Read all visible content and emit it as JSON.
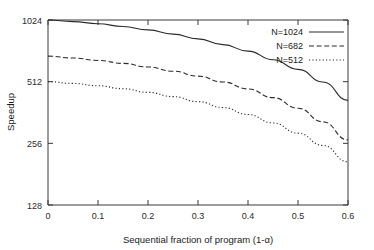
{
  "chart_data": {
    "type": "line",
    "title": "",
    "xlabel": "Sequential fraction of program (1-α)",
    "ylabel": "Speedup",
    "xlim": [
      0,
      0.6
    ],
    "ylim": [
      128,
      1024
    ],
    "yscale": "log2",
    "grid": false,
    "legend_position": "top-right",
    "xticks": [
      "0",
      "0.1",
      "0.2",
      "0.3",
      "0.4",
      "0.5",
      "0.6"
    ],
    "xtick_values": [
      0,
      0.1,
      0.2,
      0.3,
      0.4,
      0.5,
      0.6
    ],
    "yticks": [
      "128",
      "256",
      "512",
      "1024"
    ],
    "ytick_values": [
      128,
      256,
      512,
      1024
    ],
    "x": [
      0,
      0.05,
      0.1,
      0.15,
      0.2,
      0.25,
      0.3,
      0.35,
      0.4,
      0.45,
      0.5,
      0.55,
      0.6
    ],
    "series": [
      {
        "name": "N=1024",
        "label": "N=1024",
        "style": "solid",
        "values": [
          1024,
          1006,
          982,
          952,
          916,
          874,
          828,
          776,
          722,
          655,
          588,
          510,
          415
        ]
      },
      {
        "name": "N=682",
        "label": "N=682",
        "style": "dashed",
        "values": [
          682,
          668,
          650,
          629,
          604,
          576,
          545,
          510,
          472,
          428,
          380,
          326,
          266
        ]
      },
      {
        "name": "N=512",
        "label": "N=512",
        "style": "dotted",
        "values": [
          512,
          502,
          489,
          473,
          454,
          433,
          409,
          383,
          354,
          322,
          287,
          250,
          208
        ]
      }
    ]
  },
  "legend": {
    "entries": [
      {
        "label": "N=1024",
        "style": "solid"
      },
      {
        "label": "N=682",
        "style": "dashed"
      },
      {
        "label": "N=512",
        "style": "dotted"
      }
    ]
  },
  "colors": {
    "axis": "#3a3a3a",
    "curve": "#2b2b2b",
    "background": "#ffffff",
    "text": "#1a1a1a"
  }
}
